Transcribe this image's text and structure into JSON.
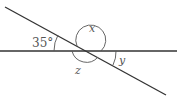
{
  "diagram": {
    "type": "intersecting-lines-angles",
    "labels": {
      "given_angle": "35°",
      "x": "x",
      "y": "y",
      "z": "z"
    },
    "colors": {
      "line": "#333333",
      "arc": "#555555",
      "text": "#555555"
    }
  }
}
